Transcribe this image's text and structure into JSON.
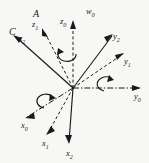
{
  "figure": {
    "name": "coordinate-frame-rotation-diagram",
    "background_color": "#f7f7f5",
    "stroke_color": "#1a1a1a",
    "origin": {
      "x": 73,
      "y": 88
    },
    "frame_labels": [
      {
        "id": "frame-a",
        "text": "A",
        "x": 33,
        "y": 9
      },
      {
        "id": "frame-c",
        "text": "C",
        "x": 9,
        "y": 27
      }
    ],
    "axes": [
      {
        "id": "axis-z1",
        "base": "z",
        "subscript": "1",
        "style": "dashed",
        "label_x": 32,
        "label_y": 20,
        "tip_x": 42,
        "tip_y": 29
      },
      {
        "id": "axis-z2",
        "base": "z",
        "subscript": "2",
        "style": "solid",
        "label_x": 19,
        "label_y": 34,
        "tip_x": 13,
        "tip_y": 36
      },
      {
        "id": "axis-z0",
        "base": "z",
        "subscript": "0",
        "style": "dashed",
        "label_x": 60,
        "label_y": 17,
        "tip_x": 73,
        "tip_y": 20
      },
      {
        "id": "axis-w0",
        "base": "w",
        "subscript": "0",
        "style": "none",
        "label_x": 86,
        "label_y": 7,
        "tip_x": 86,
        "tip_y": 7
      },
      {
        "id": "axis-y2",
        "base": "y",
        "subscript": "2",
        "style": "solid",
        "label_x": 113,
        "label_y": 32,
        "tip_x": 111,
        "tip_y": 34
      },
      {
        "id": "axis-y1",
        "base": "y",
        "subscript": "1",
        "style": "dashed",
        "label_x": 124,
        "label_y": 57,
        "tip_x": 122,
        "tip_y": 52
      },
      {
        "id": "axis-y0",
        "base": "y",
        "subscript": "0",
        "style": "dashdot",
        "label_x": 134,
        "label_y": 92,
        "tip_x": 140,
        "tip_y": 88
      },
      {
        "id": "axis-x0",
        "base": "x",
        "subscript": "0",
        "style": "dashdot",
        "label_x": 21,
        "label_y": 121,
        "tip_x": 26,
        "tip_y": 118
      },
      {
        "id": "axis-x1",
        "base": "x",
        "subscript": "1",
        "style": "dashed",
        "label_x": 42,
        "label_y": 139,
        "tip_x": 47,
        "tip_y": 135
      },
      {
        "id": "axis-x2",
        "base": "x",
        "subscript": "2",
        "style": "solid",
        "label_x": 66,
        "label_y": 149,
        "tip_x": 68,
        "tip_y": 144
      }
    ],
    "rotation_arrows": [
      {
        "id": "rotation-arrow-z0",
        "about": "z0",
        "cx": 68,
        "cy": 56
      },
      {
        "id": "rotation-arrow-y0",
        "about": "y0",
        "cx": 102,
        "cy": 84
      },
      {
        "id": "rotation-arrow-x0",
        "about": "x0",
        "cx": 44,
        "cy": 101
      }
    ]
  }
}
